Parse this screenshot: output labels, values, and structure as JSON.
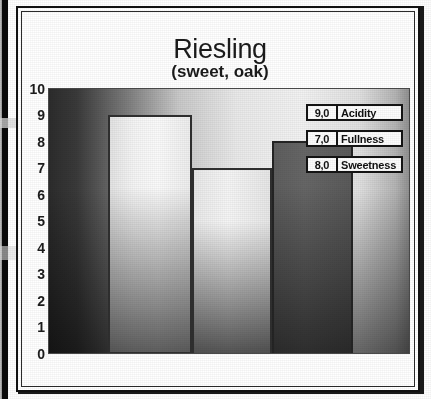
{
  "chart_data": {
    "type": "bar",
    "title": "Riesling",
    "subtitle": "(sweet, oak)",
    "categories": [
      "Acidity",
      "Fullness",
      "Sweetness"
    ],
    "values": [
      9.0,
      7.0,
      8.0
    ],
    "value_labels": [
      "9,0",
      "7,0",
      "8,0"
    ],
    "xlabel": "",
    "ylabel": "",
    "ylim": [
      0,
      10
    ],
    "yticks": [
      "10",
      "9",
      "8",
      "7",
      "6",
      "5",
      "4",
      "3",
      "2",
      "1",
      "0"
    ],
    "grid": false,
    "legend_position": "inside-top-right",
    "series": [
      {
        "name": "Acidity",
        "value": 9.0,
        "label": "9,0",
        "fill": "#f4f4f4"
      },
      {
        "name": "Fullness",
        "value": 7.0,
        "label": "7,0",
        "fill": "#ededed"
      },
      {
        "name": "Sweetness",
        "value": 8.0,
        "label": "8,0",
        "fill": "#616161"
      }
    ]
  },
  "chart": {
    "title": "Riesling",
    "subtitle": "(sweet, oak)",
    "yticks": [
      "10",
      "9",
      "8",
      "7",
      "6",
      "5",
      "4",
      "3",
      "2",
      "1",
      "0"
    ],
    "legend": [
      {
        "value": "9,0",
        "label": "Acidity"
      },
      {
        "value": "7,0",
        "label": "Fullness"
      },
      {
        "value": "8,0",
        "label": "Sweetness"
      }
    ]
  },
  "colors": {
    "frame": "#111111",
    "text": "#1b1b1b",
    "bar_light": "#f4f4f4",
    "bar_dark": "#616161",
    "plot_dark": "#2b2b2b",
    "plot_light": "#f2f2f2"
  }
}
